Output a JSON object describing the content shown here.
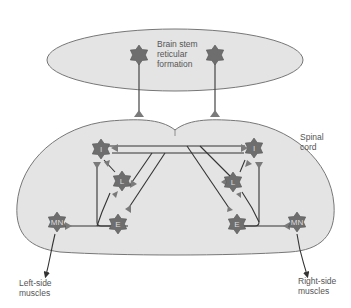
{
  "diagram": {
    "labels": {
      "brainstem": [
        "Brain stem",
        "reticular",
        "formation"
      ],
      "spinal_cord": [
        "Spinal",
        "cord"
      ],
      "left_muscles": [
        "Left-side",
        "muscles"
      ],
      "right_muscles": [
        "Right-side",
        "muscles"
      ]
    },
    "neurons": {
      "left_I": "I",
      "left_L": "L",
      "left_E": "E",
      "left_MN": "MN",
      "right_I": "I",
      "right_L": "L",
      "right_E": "E",
      "right_MN": "MN"
    },
    "colors": {
      "region_fill": "#e4e4e4",
      "outline": "#777777",
      "neuron": "#6e6e6e",
      "terminal": "#7a7a7a",
      "axon": "#333333",
      "text": "#555555"
    }
  }
}
